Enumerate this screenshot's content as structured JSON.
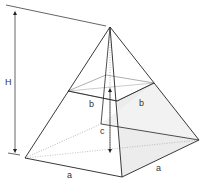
{
  "diagram": {
    "labels": {
      "height": "H",
      "base_side_left": "a",
      "base_side_right": "a",
      "section_side_left": "b",
      "section_side_right": "b",
      "frustum_height": "c"
    },
    "colors": {
      "line": "#222222",
      "thin_line": "#666666",
      "shade": "#e9e9e9",
      "dotted": "#888888"
    },
    "vertices": {
      "apex": [
        110,
        27
      ],
      "base_left": [
        25,
        158
      ],
      "base_front": [
        122,
        177
      ],
      "base_right": [
        199,
        140
      ],
      "base_back": [
        101,
        124
      ],
      "mid_left": [
        68,
        91
      ],
      "mid_front": [
        117,
        101
      ],
      "mid_right": [
        154,
        83
      ],
      "mid_back": [
        106,
        75
      ]
    }
  }
}
